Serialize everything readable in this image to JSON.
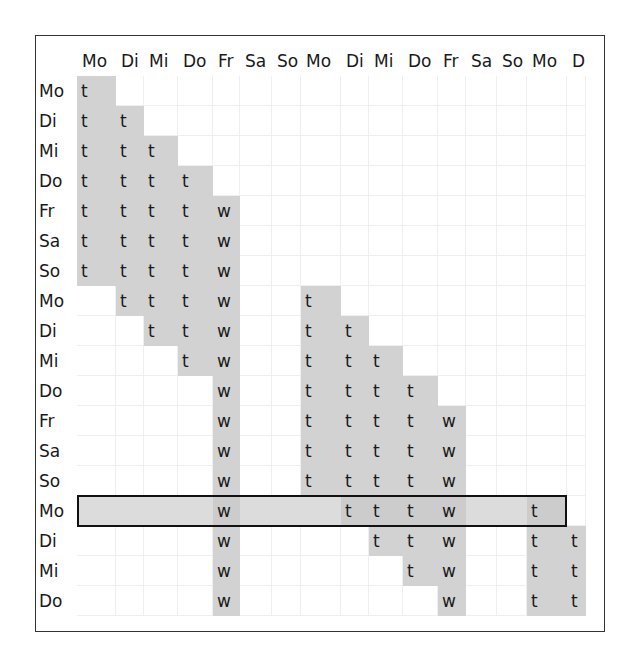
{
  "columns": [
    "Mo",
    "Di",
    "Mi",
    "Do",
    "Fr",
    "Sa",
    "So",
    "Mo",
    "Di",
    "Mi",
    "Do",
    "Fr",
    "Sa",
    "So",
    "Mo",
    "D"
  ],
  "column_x": [
    77,
    116,
    144,
    178,
    213,
    240,
    272,
    301,
    341,
    369,
    403,
    438,
    466,
    497,
    527,
    567,
    586
  ],
  "rows": [
    {
      "label": "Mo",
      "cells": {
        "0": "t"
      },
      "shaded": [
        0
      ]
    },
    {
      "label": "Di",
      "cells": {
        "0": "t",
        "1": "t"
      },
      "shaded": [
        0,
        1
      ]
    },
    {
      "label": "Mi",
      "cells": {
        "0": "t",
        "1": "t",
        "2": "t"
      },
      "shaded": [
        0,
        1,
        2
      ]
    },
    {
      "label": "Do",
      "cells": {
        "0": "t",
        "1": "t",
        "2": "t",
        "3": "t"
      },
      "shaded": [
        0,
        1,
        2,
        3
      ]
    },
    {
      "label": "Fr",
      "cells": {
        "0": "t",
        "1": "t",
        "2": "t",
        "3": "t",
        "4": "w"
      },
      "shaded": [
        0,
        1,
        2,
        3,
        4
      ]
    },
    {
      "label": "Sa",
      "cells": {
        "0": "t",
        "1": "t",
        "2": "t",
        "3": "t",
        "4": "w"
      },
      "shaded": [
        0,
        1,
        2,
        3,
        4
      ]
    },
    {
      "label": "So",
      "cells": {
        "0": "t",
        "1": "t",
        "2": "t",
        "3": "t",
        "4": "w"
      },
      "shaded": [
        0,
        1,
        2,
        3,
        4
      ]
    },
    {
      "label": "Mo",
      "cells": {
        "1": "t",
        "2": "t",
        "3": "t",
        "4": "w",
        "7": "t"
      },
      "shaded": [
        1,
        2,
        3,
        4,
        7
      ]
    },
    {
      "label": "Di",
      "cells": {
        "2": "t",
        "3": "t",
        "4": "w",
        "7": "t",
        "8": "t"
      },
      "shaded": [
        2,
        3,
        4,
        7,
        8
      ]
    },
    {
      "label": "Mi",
      "cells": {
        "3": "t",
        "4": "w",
        "7": "t",
        "8": "t",
        "9": "t"
      },
      "shaded": [
        3,
        4,
        7,
        8,
        9
      ]
    },
    {
      "label": "Do",
      "cells": {
        "4": "w",
        "7": "t",
        "8": "t",
        "9": "t",
        "10": "t"
      },
      "shaded": [
        4,
        7,
        8,
        9,
        10
      ]
    },
    {
      "label": "Fr",
      "cells": {
        "4": "w",
        "7": "t",
        "8": "t",
        "9": "t",
        "10": "t",
        "11": "w"
      },
      "shaded": [
        4,
        7,
        8,
        9,
        10,
        11
      ]
    },
    {
      "label": "Sa",
      "cells": {
        "4": "w",
        "7": "t",
        "8": "t",
        "9": "t",
        "10": "t",
        "11": "w"
      },
      "shaded": [
        4,
        7,
        8,
        9,
        10,
        11
      ]
    },
    {
      "label": "So",
      "cells": {
        "4": "w",
        "7": "t",
        "8": "t",
        "9": "t",
        "10": "t",
        "11": "w"
      },
      "shaded": [
        4,
        7,
        8,
        9,
        10,
        11
      ]
    },
    {
      "label": "Mo",
      "cells": {
        "4": "w",
        "8": "t",
        "9": "t",
        "10": "t",
        "11": "w",
        "14": "t"
      },
      "shaded": [
        4,
        8,
        9,
        10,
        11,
        14
      ],
      "highlighted": true
    },
    {
      "label": "Di",
      "cells": {
        "4": "w",
        "9": "t",
        "10": "t",
        "11": "w",
        "14": "t",
        "15": "t"
      },
      "shaded": [
        4,
        9,
        10,
        11,
        14,
        15
      ]
    },
    {
      "label": "Mi",
      "cells": {
        "4": "w",
        "10": "t",
        "11": "w",
        "14": "t",
        "15": "t"
      },
      "shaded": [
        4,
        10,
        11,
        14,
        15
      ]
    },
    {
      "label": "Do",
      "cells": {
        "4": "w",
        "11": "w",
        "14": "t",
        "15": "t"
      },
      "shaded": [
        4,
        11,
        14,
        15
      ]
    }
  ],
  "highlight": {
    "row_index": 14,
    "from_col": 0,
    "to_col": 14
  },
  "colors": {
    "shade": "#d2d2d2",
    "highlight": "#dcdcdc",
    "highlight_border": "#111111"
  }
}
